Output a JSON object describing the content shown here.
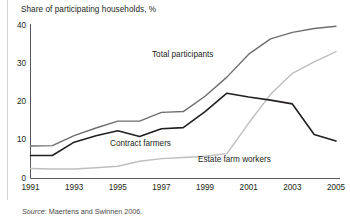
{
  "chart_data": {
    "type": "line",
    "title": "Share of participating households, %",
    "xlabel": "",
    "ylabel": "",
    "ylim": [
      0,
      40
    ],
    "xlim": [
      1991,
      2005
    ],
    "yticks": [
      "0",
      "10",
      "20",
      "30",
      "40"
    ],
    "ytick_values": [
      0,
      10,
      20,
      30,
      40
    ],
    "xticks": [
      "1991",
      "1993",
      "1995",
      "1997",
      "1999",
      "2001",
      "2003",
      "2005"
    ],
    "xtick_values": [
      1991,
      1993,
      1995,
      1997,
      1999,
      2001,
      2003,
      2005
    ],
    "x": [
      1991,
      1992,
      1993,
      1994,
      1995,
      1996,
      1997,
      1998,
      1999,
      2000,
      2001,
      2002,
      2003,
      2004,
      2005
    ],
    "grid": false,
    "legend_position": "inline-annotations",
    "series": [
      {
        "name": "Total participants",
        "color": "#6d6e71",
        "values": [
          8.5,
          8.6,
          11.2,
          13.2,
          15.0,
          15.0,
          17.3,
          17.5,
          21.5,
          26.5,
          32.5,
          36.5,
          38.2,
          39.2,
          39.8
        ]
      },
      {
        "name": "Contract farmers",
        "color": "#231f20",
        "values": [
          6.0,
          6.0,
          9.5,
          11.2,
          12.5,
          11.0,
          13.0,
          13.3,
          17.5,
          22.3,
          21.3,
          20.5,
          19.5,
          11.5,
          9.8
        ]
      },
      {
        "name": "Estate farm workers",
        "color": "#bcbec0",
        "values": [
          2.6,
          2.5,
          2.5,
          2.8,
          3.2,
          4.5,
          5.2,
          5.5,
          5.8,
          6.5,
          14.5,
          22.0,
          27.5,
          30.5,
          33.2
        ]
      }
    ],
    "annotations": [
      {
        "text": "Total participants",
        "x_px": 152,
        "y_px": 50
      },
      {
        "text": "Contract farmers",
        "x_px": 110,
        "y_px": 139
      },
      {
        "text": "Estate farm workers",
        "x_px": 198,
        "y_px": 155
      }
    ]
  },
  "source": {
    "label": "Source",
    "separator": ": ",
    "text": "Maertens and Swinnen 2006."
  }
}
